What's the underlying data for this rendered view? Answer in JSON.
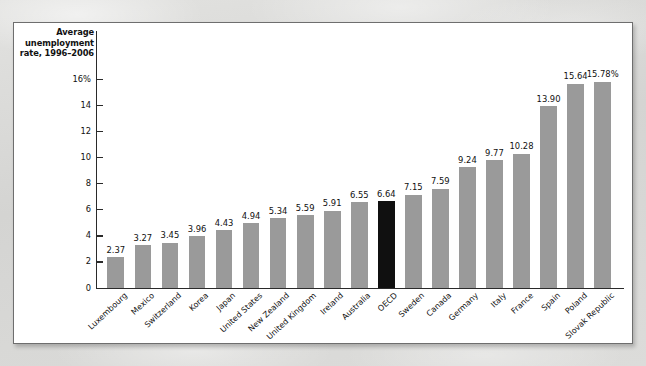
{
  "figure": {
    "axis_title": "Average\nunemployment\nrate, 1996–2006",
    "axis_title_line1": "Average",
    "axis_title_line2": "unemployment",
    "axis_title_line3": "rate, 1996–2006",
    "bar_color": "#9a9a9a",
    "highlight_color": "#101010",
    "highlight_category": "OECD"
  },
  "chart_data": {
    "type": "bar",
    "title": "",
    "subtitle": "",
    "xlabel": "",
    "ylabel": "Average unemployment rate, 1996–2006",
    "ylim": [
      0,
      16
    ],
    "yticks": [
      0,
      2,
      4,
      6,
      8,
      10,
      12,
      14,
      16
    ],
    "ytick_labels": [
      "0",
      "2",
      "4",
      "6",
      "8",
      "10",
      "12",
      "14",
      "16%"
    ],
    "grid": false,
    "legend": "none",
    "orientation": "vertical",
    "categories": [
      "Luxembourg",
      "Mexico",
      "Switzerland",
      "Korea",
      "Japan",
      "United States",
      "New Zealand",
      "United Kingdom",
      "Ireland",
      "Australia",
      "OECD",
      "Sweden",
      "Canada",
      "Germany",
      "Italy",
      "France",
      "Spain",
      "Poland",
      "Slovak Republic"
    ],
    "values": [
      2.37,
      3.27,
      3.45,
      3.96,
      4.43,
      4.94,
      5.34,
      5.59,
      5.91,
      6.55,
      6.64,
      7.15,
      7.59,
      9.24,
      9.77,
      10.28,
      13.9,
      15.64,
      15.78
    ],
    "value_labels": [
      "2.37",
      "3.27",
      "3.45",
      "3.96",
      "4.43",
      "4.94",
      "5.34",
      "5.59",
      "5.91",
      "6.55",
      "6.64",
      "7.15",
      "7.59",
      "9.24",
      "9.77",
      "10.28",
      "13.90",
      "15.64",
      "15.78%"
    ],
    "highlighted_indices": [
      10
    ]
  }
}
